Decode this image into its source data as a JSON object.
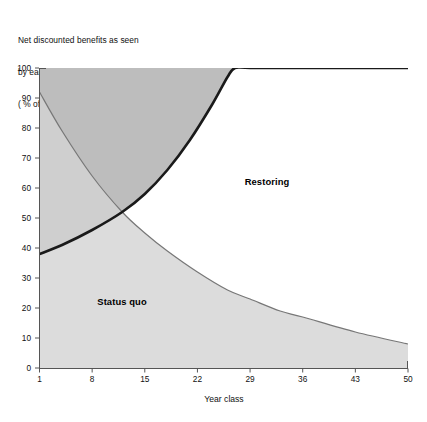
{
  "title": {
    "line1": "Net discounted benefits as seen",
    "line2": "by each year class",
    "line3": "( % of maximum)"
  },
  "axes": {
    "xlabel": "Year class",
    "ylabel": "",
    "xticks": [
      "1",
      "8",
      "15",
      "22",
      "29",
      "36",
      "43",
      "50"
    ],
    "yticks": [
      "0",
      "10",
      "20",
      "30",
      "40",
      "50",
      "60",
      "70",
      "80",
      "90",
      "100"
    ]
  },
  "labels": {
    "restoring": "Restoring",
    "status_quo": "Status quo"
  },
  "colors": {
    "restoring_fill": "#bdbdbd",
    "status_quo_fill": "#dcdcdc",
    "restoring_line": "#1a1a1a",
    "status_quo_line": "#777777",
    "axis": "#555555",
    "background": "#ffffff"
  },
  "chart_data": {
    "type": "area",
    "title": "Net discounted benefits as seen by each year class ( % of maximum)",
    "xlabel": "Year class",
    "ylabel": "% of maximum",
    "xlim": [
      1,
      50
    ],
    "ylim": [
      0,
      100
    ],
    "xticks": [
      1,
      8,
      15,
      22,
      29,
      36,
      43,
      50
    ],
    "yticks": [
      0,
      10,
      20,
      30,
      40,
      50,
      60,
      70,
      80,
      90,
      100
    ],
    "grid": false,
    "legend": "in-plot region labels",
    "crossing_point": {
      "x": 12,
      "y": 52
    },
    "series": [
      {
        "name": "Restoring",
        "fill": "#bdbdbd",
        "line": "#1a1a1a",
        "line_width": 2.6,
        "x": [
          1,
          4,
          8,
          12,
          15,
          18,
          21,
          24,
          26,
          27,
          29,
          36,
          43,
          50
        ],
        "values": [
          38,
          41,
          46,
          52,
          58,
          66,
          76,
          88,
          97,
          100,
          100,
          100,
          100,
          100
        ]
      },
      {
        "name": "Status quo",
        "fill": "#dcdcdc",
        "line": "#777777",
        "line_width": 1.2,
        "x": [
          1,
          4,
          8,
          12,
          15,
          18,
          22,
          26,
          29,
          33,
          36,
          43,
          50
        ],
        "values": [
          92,
          79,
          64,
          52,
          45,
          39,
          32,
          26,
          23,
          19,
          17,
          12,
          8
        ]
      }
    ]
  }
}
